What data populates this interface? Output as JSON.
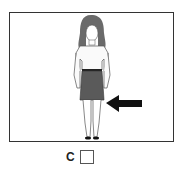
{
  "figure": {
    "arrow_direction": "left",
    "arrow_target": "knees",
    "colors": {
      "skirt": "#5a5a5a",
      "hair": "#6a6a6a",
      "arrow": "#111111",
      "outline": "#444444"
    }
  },
  "option": {
    "label": "C",
    "checked": false
  }
}
